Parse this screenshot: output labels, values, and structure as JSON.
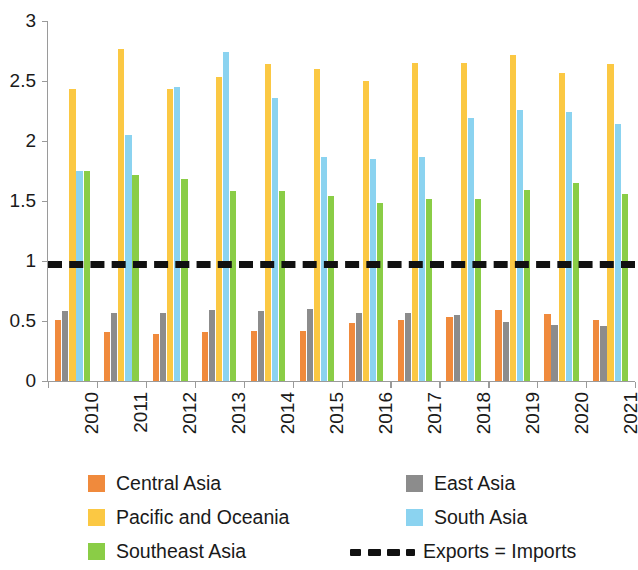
{
  "chart_data": {
    "type": "bar",
    "title": "",
    "subtitle": "",
    "xlabel": "",
    "ylabel": "",
    "ylim": [
      0,
      3
    ],
    "ytick_values": [
      0,
      0.5,
      1,
      1.5,
      2,
      2.5,
      3
    ],
    "ytick_labels": [
      "0",
      "0.5",
      "1",
      "1.5",
      "2",
      "2.5",
      "3"
    ],
    "grid": false,
    "legend_position": "bottom",
    "categories": [
      "2010",
      "2011",
      "2012",
      "2013",
      "2014",
      "2015",
      "2016",
      "2017",
      "2018",
      "2019",
      "2020",
      "2021"
    ],
    "series": [
      {
        "name": "Central Asia",
        "color": "#F08A3C",
        "values": [
          0.51,
          0.41,
          0.39,
          0.41,
          0.42,
          0.42,
          0.48,
          0.51,
          0.53,
          0.59,
          0.56,
          0.51
        ]
      },
      {
        "name": "East Asia",
        "color": "#8C8C8C",
        "values": [
          0.58,
          0.57,
          0.57,
          0.59,
          0.58,
          0.6,
          0.57,
          0.57,
          0.55,
          0.49,
          0.47,
          0.46
        ]
      },
      {
        "name": "Pacific and Oceania",
        "color": "#FBC843",
        "values": [
          2.43,
          2.77,
          2.43,
          2.53,
          2.64,
          2.6,
          2.5,
          2.65,
          2.65,
          2.72,
          2.57,
          2.64
        ]
      },
      {
        "name": "South Asia",
        "color": "#8BD3F0",
        "values": [
          1.75,
          2.05,
          2.45,
          2.74,
          2.36,
          1.87,
          1.85,
          1.87,
          2.19,
          2.26,
          2.24,
          2.14
        ]
      },
      {
        "name": "Southeast Asia",
        "color": "#8ACD46",
        "values": [
          1.75,
          1.72,
          1.68,
          1.58,
          1.58,
          1.54,
          1.48,
          1.52,
          1.52,
          1.59,
          1.65,
          1.56
        ]
      }
    ],
    "reference_line": {
      "label": "Exports = Imports",
      "value": 1,
      "style": "dashed",
      "color": "#111111"
    }
  },
  "legend": {
    "items": [
      {
        "label": "Central Asia",
        "marker": "swatch",
        "color": "#F08A3C"
      },
      {
        "label": "East Asia",
        "marker": "swatch",
        "color": "#8C8C8C"
      },
      {
        "label": "Pacific and Oceania",
        "marker": "swatch",
        "color": "#FBC843"
      },
      {
        "label": "South Asia",
        "marker": "swatch",
        "color": "#8BD3F0"
      },
      {
        "label": "Southeast Asia",
        "marker": "swatch",
        "color": "#8ACD46"
      },
      {
        "label": "Exports = Imports",
        "marker": "dashed",
        "color": "#111111"
      }
    ]
  }
}
